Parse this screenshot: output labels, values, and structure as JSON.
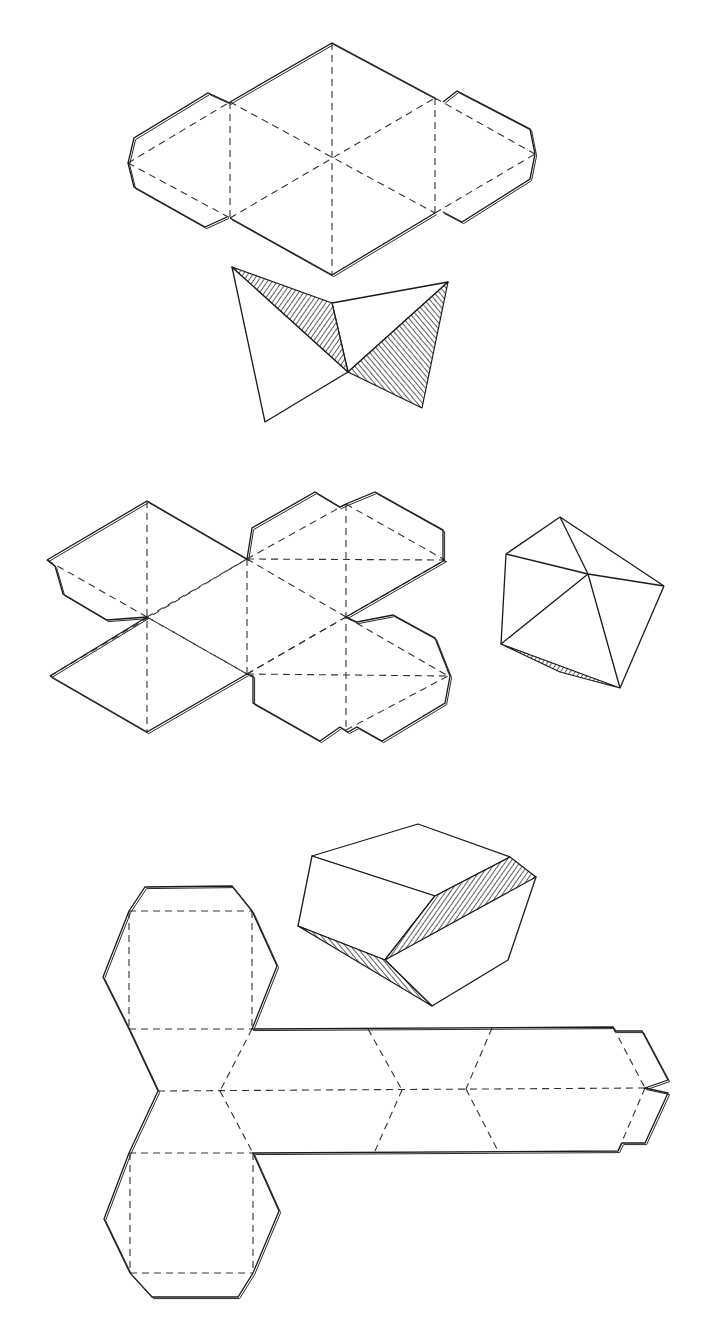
{
  "figure": {
    "background": "#ffffff",
    "line_color": "#1a1a1a",
    "width": 704,
    "height": 1317
  },
  "panels": [
    {
      "name": "octahedron-net-hexagon",
      "cut": [
        [
          [
            230,
            102
          ],
          [
            332,
            43
          ],
          [
            435,
            98
          ]
        ],
        [
          [
            230,
            218
          ],
          [
            332,
            275
          ],
          [
            435,
            213
          ]
        ],
        [
          [
            230,
            103
          ],
          [
            208,
            93
          ],
          [
            134,
            138
          ],
          [
            128,
            163
          ],
          [
            134,
            187
          ],
          [
            205,
            227
          ],
          [
            227,
            217
          ]
        ],
        [
          [
            443,
            102
          ],
          [
            457,
            91
          ],
          [
            530,
            129
          ],
          [
            535,
            154
          ],
          [
            530,
            179
          ],
          [
            462,
            222
          ],
          [
            443,
            212
          ]
        ]
      ],
      "fold": [
        [
          [
            332,
            43
          ],
          [
            332,
            275
          ]
        ],
        [
          [
            230,
            102
          ],
          [
            230,
            218
          ]
        ],
        [
          [
            435,
            98
          ],
          [
            435,
            213
          ]
        ],
        [
          [
            128,
            163
          ],
          [
            230,
            102
          ]
        ],
        [
          [
            128,
            163
          ],
          [
            230,
            218
          ]
        ],
        [
          [
            230,
            102
          ],
          [
            435,
            213
          ]
        ],
        [
          [
            230,
            218
          ],
          [
            435,
            98
          ]
        ],
        [
          [
            435,
            98
          ],
          [
            535,
            154
          ]
        ],
        [
          [
            435,
            213
          ],
          [
            535,
            154
          ]
        ]
      ]
    },
    {
      "name": "octahedron-folding-view",
      "faces": [
        [
          [
            232,
            267
          ],
          [
            348,
            372
          ],
          [
            265,
            422
          ]
        ],
        [
          [
            332,
            303
          ],
          [
            448,
            282
          ],
          [
            348,
            372
          ]
        ]
      ],
      "shaded": [
        [
          [
            232,
            267
          ],
          [
            332,
            303
          ],
          [
            348,
            372
          ]
        ],
        [
          [
            348,
            372
          ],
          [
            448,
            282
          ],
          [
            422,
            408
          ]
        ]
      ]
    },
    {
      "name": "icosahedron-net",
      "cut": [
        [
          [
            47,
            560
          ],
          [
            147,
            501
          ],
          [
            247,
            559
          ]
        ],
        [
          [
            50,
            676
          ],
          [
            147,
            732
          ],
          [
            247,
            674
          ]
        ],
        [
          [
            47,
            560
          ],
          [
            55,
            566
          ],
          [
            63,
            594
          ],
          [
            107,
            620
          ],
          [
            147,
            617
          ]
        ],
        [
          [
            247,
            559
          ],
          [
            252,
            528
          ],
          [
            315,
            492
          ],
          [
            340,
            507
          ],
          [
            346,
            504
          ]
        ],
        [
          [
            346,
            504
          ],
          [
            375,
            492
          ],
          [
            443,
            530
          ],
          [
            443,
            560
          ],
          [
            445,
            560
          ]
        ],
        [
          [
            346,
            617
          ],
          [
            357,
            622
          ],
          [
            393,
            615
          ],
          [
            435,
            638
          ],
          [
            450,
            676
          ],
          [
            445,
            703
          ],
          [
            382,
            741
          ],
          [
            357,
            727
          ],
          [
            348,
            732
          ],
          [
            340,
            727
          ],
          [
            320,
            741
          ],
          [
            253,
            703
          ],
          [
            253,
            676
          ],
          [
            247,
            674
          ]
        ],
        [
          [
            147,
            617
          ],
          [
            50,
            676
          ]
        ],
        [
          [
            445,
            560
          ],
          [
            346,
            617
          ]
        ]
      ],
      "fold": [
        [
          [
            147,
            501
          ],
          [
            147,
            732
          ]
        ],
        [
          [
            247,
            559
          ],
          [
            247,
            674
          ]
        ],
        [
          [
            346,
            504
          ],
          [
            346,
            732
          ]
        ],
        [
          [
            47,
            560
          ],
          [
            247,
            674
          ]
        ],
        [
          [
            50,
            676
          ],
          [
            247,
            559
          ]
        ],
        [
          [
            247,
            559
          ],
          [
            346,
            504
          ]
        ],
        [
          [
            247,
            559
          ],
          [
            445,
            560
          ]
        ],
        [
          [
            247,
            674
          ],
          [
            445,
            560
          ]
        ],
        [
          [
            247,
            674
          ],
          [
            448,
            676
          ]
        ],
        [
          [
            346,
            617
          ],
          [
            448,
            676
          ]
        ],
        [
          [
            346,
            504
          ],
          [
            445,
            560
          ]
        ],
        [
          [
            147,
            617
          ],
          [
            247,
            559
          ]
        ],
        [
          [
            147,
            617
          ],
          [
            247,
            674
          ]
        ],
        [
          [
            247,
            559
          ],
          [
            346,
            617
          ]
        ],
        [
          [
            247,
            674
          ],
          [
            346,
            617
          ]
        ],
        [
          [
            346,
            730
          ],
          [
            448,
            676
          ]
        ]
      ]
    },
    {
      "name": "icosahedron-folded-view",
      "edges": [
        [
          [
            560,
            517
          ],
          [
            506,
            554
          ]
        ],
        [
          [
            560,
            517
          ],
          [
            664,
            586
          ]
        ],
        [
          [
            560,
            517
          ],
          [
            588,
            574
          ]
        ],
        [
          [
            506,
            554
          ],
          [
            588,
            574
          ]
        ],
        [
          [
            588,
            574
          ],
          [
            664,
            586
          ]
        ],
        [
          [
            506,
            554
          ],
          [
            501,
            644
          ]
        ],
        [
          [
            501,
            644
          ],
          [
            588,
            574
          ]
        ],
        [
          [
            588,
            574
          ],
          [
            620,
            688
          ]
        ],
        [
          [
            664,
            586
          ],
          [
            620,
            688
          ]
        ]
      ],
      "shaded": [
        [
          [
            501,
            644
          ],
          [
            620,
            688
          ],
          [
            560,
            672
          ]
        ]
      ]
    },
    {
      "name": "hexagonal-prism-view",
      "faces": [
        [
          [
            312,
            856
          ],
          [
            418,
            824
          ],
          [
            510,
            857
          ],
          [
            435,
            896
          ]
        ],
        [
          [
            312,
            856
          ],
          [
            435,
            896
          ],
          [
            385,
            960
          ],
          [
            298,
            926
          ]
        ],
        [
          [
            435,
            896
          ],
          [
            536,
            877
          ],
          [
            508,
            960
          ],
          [
            432,
            1006
          ],
          [
            385,
            960
          ]
        ]
      ],
      "shaded": [
        [
          [
            435,
            896
          ],
          [
            510,
            857
          ],
          [
            536,
            877
          ],
          [
            385,
            960
          ]
        ],
        [
          [
            298,
            926
          ],
          [
            385,
            960
          ],
          [
            432,
            1006
          ]
        ]
      ]
    },
    {
      "name": "hexagonal-prism-net",
      "cut": [
        [
          [
            129,
            911
          ],
          [
            145,
            887
          ],
          [
            232,
            886
          ],
          [
            252,
            911
          ]
        ],
        [
          [
            129,
            911
          ],
          [
            103,
            977
          ],
          [
            129,
            1029
          ],
          [
            158,
            1091
          ],
          [
            129,
            1153
          ],
          [
            104,
            1219
          ],
          [
            130,
            1273
          ],
          [
            152,
            1297
          ],
          [
            238,
            1297
          ],
          [
            253,
            1273
          ],
          [
            279,
            1211
          ],
          [
            253,
            1153
          ],
          [
            618,
            1151
          ],
          [
            622,
            1143
          ],
          [
            645,
            1143
          ],
          [
            668,
            1093
          ],
          [
            645,
            1088
          ],
          [
            668,
            1080
          ],
          [
            642,
            1031
          ],
          [
            615,
            1031
          ],
          [
            613,
            1027
          ],
          [
            252,
            1029
          ],
          [
            277,
            966
          ],
          [
            252,
            911
          ]
        ]
      ],
      "fold": [
        [
          [
            129,
            911
          ],
          [
            252,
            911
          ]
        ],
        [
          [
            129,
            911
          ],
          [
            129,
            1029
          ]
        ],
        [
          [
            252,
            911
          ],
          [
            252,
            1029
          ]
        ],
        [
          [
            129,
            1029
          ],
          [
            252,
            1029
          ]
        ],
        [
          [
            158,
            1091
          ],
          [
            645,
            1088
          ]
        ],
        [
          [
            252,
            1029
          ],
          [
            220,
            1091
          ]
        ],
        [
          [
            220,
            1091
          ],
          [
            253,
            1153
          ]
        ],
        [
          [
            129,
            1153
          ],
          [
            253,
            1153
          ]
        ],
        [
          [
            130,
            1153
          ],
          [
            130,
            1273
          ]
        ],
        [
          [
            253,
            1153
          ],
          [
            253,
            1273
          ]
        ],
        [
          [
            130,
            1273
          ],
          [
            253,
            1273
          ]
        ],
        [
          [
            368,
            1029
          ],
          [
            402,
            1090
          ]
        ],
        [
          [
            402,
            1090
          ],
          [
            375,
            1151
          ]
        ],
        [
          [
            492,
            1028
          ],
          [
            466,
            1089
          ]
        ],
        [
          [
            466,
            1089
          ],
          [
            498,
            1151
          ]
        ],
        [
          [
            613,
            1027
          ],
          [
            645,
            1088
          ]
        ],
        [
          [
            645,
            1088
          ],
          [
            618,
            1151
          ]
        ]
      ]
    }
  ]
}
